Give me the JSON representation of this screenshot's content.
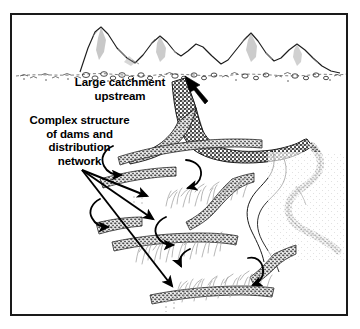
{
  "figure": {
    "kind": "schematic-diagram",
    "background_color": "#ffffff",
    "ink_color": "#000000",
    "frame": {
      "border_color": "#1a1a1a",
      "border_width_px": 2
    }
  },
  "labels": {
    "catchment": {
      "text": "Large catchment\nupstream",
      "lines": [
        "Large catchment",
        "upstream"
      ],
      "align": "center",
      "bold": true
    },
    "structure": {
      "text": "Complex structure\nof dams and\ndistribution\nnetwork",
      "lines": [
        "Complex structure",
        "of dams and",
        "distribution",
        "network"
      ],
      "align": "center",
      "bold": true
    }
  },
  "elements": {
    "mountains": {
      "name": "mountain-range",
      "peaks": 6,
      "outline_color": "#000000",
      "shading_color": "#8c8c8c",
      "foothill_band": "stippled rubble / boulder fan"
    },
    "wadi": {
      "name": "wadi-channel",
      "fill_color": "#4a4a4a",
      "description": "dark stippled braided channel descending from the foothills and branching downstream"
    },
    "river_banks": {
      "name": "meandering-river",
      "fill_color": "#9a9a9a",
      "description": "stippled banks of a meandering channel on the right"
    },
    "dams": {
      "name": "diversion-dam-walls",
      "count": 7,
      "fill_color": "#6e6e6e",
      "description": "coarse stippled bunds laid out as stepped terraces"
    },
    "fields": {
      "name": "irrigated-fields",
      "count": 3,
      "stroke_color": "#a9a9a9",
      "description": "hatched squiggly crop vegetation above each lower bund"
    },
    "flow_arrows": {
      "name": "water-flow-arrows",
      "count": 6,
      "color": "#000000",
      "description": "curved hook arrows showing water cascading from bund to bund"
    },
    "pointer_arrows": {
      "name": "label-pointer-arrows",
      "count": 4,
      "color": "#000000",
      "description": "one thick arrow to the catchment, three fanning arrows to the dam network"
    },
    "outflow": {
      "name": "tail-outflow",
      "style": "dotted",
      "color": "#b5b5b5"
    }
  }
}
